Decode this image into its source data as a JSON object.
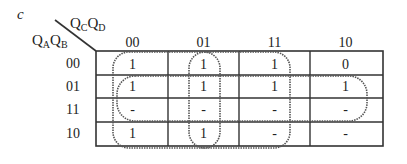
{
  "title": "c",
  "corner": {
    "col_var": {
      "letters": [
        "Q",
        "Q"
      ],
      "subs": [
        "C",
        "D"
      ]
    },
    "row_var": {
      "letters": [
        "Q",
        "Q"
      ],
      "subs": [
        "A",
        "B"
      ]
    }
  },
  "columns": [
    "00",
    "01",
    "11",
    "10"
  ],
  "rows": [
    "00",
    "01",
    "11",
    "10"
  ],
  "cells": [
    [
      "1",
      "1",
      "1",
      "0"
    ],
    [
      "1",
      "1",
      "1",
      "1"
    ],
    [
      "-",
      "-",
      "-",
      "-"
    ],
    [
      "1",
      "1",
      "-",
      "-"
    ]
  ],
  "groups": [
    {
      "name": "QA'... columns 00-01 all rows",
      "cols": [
        "00",
        "01"
      ],
      "rows": [
        "00",
        "01",
        "11",
        "10"
      ]
    },
    {
      "name": "columns 01-11 all rows",
      "cols": [
        "01",
        "11"
      ],
      "rows": [
        "00",
        "01",
        "11",
        "10"
      ]
    },
    {
      "name": "rows 01-11 all columns",
      "cols": [
        "00",
        "01",
        "11",
        "10"
      ],
      "rows": [
        "01",
        "11"
      ]
    }
  ],
  "colors": {
    "grid": "#333333",
    "loop": "#555555",
    "text": "#222222"
  }
}
